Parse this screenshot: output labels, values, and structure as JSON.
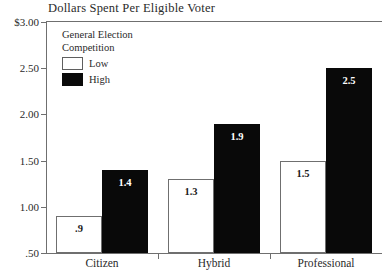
{
  "chart_data": {
    "type": "bar",
    "title": "Dollars Spent Per Eligible Voter",
    "xlabel": "",
    "ylabel": "",
    "categories": [
      "Citizen",
      "Hybrid",
      "Professional"
    ],
    "series": [
      {
        "name": "Low",
        "values": [
          0.9,
          1.3,
          1.5
        ],
        "labels": [
          ".9",
          "1.3",
          "1.5"
        ],
        "color": "#ffffff"
      },
      {
        "name": "High",
        "values": [
          1.4,
          1.9,
          2.5
        ],
        "labels": [
          "1.4",
          "1.9",
          "2.5"
        ],
        "color": "#090909"
      }
    ],
    "ylim": [
      0.5,
      3.0
    ],
    "ytick_values": [
      3.0,
      2.5,
      2.0,
      1.5,
      1.0,
      0.5
    ],
    "ytick_labels": [
      "$3.00",
      "2.50",
      "2.00",
      "1.50",
      "1.00",
      ".50"
    ],
    "grid": false,
    "legend_position": "inside-top-left"
  },
  "legend": {
    "title_line1": "General Election",
    "title_line2": "Competition",
    "entries": [
      {
        "label": "Low",
        "swatch": "white-square-outline"
      },
      {
        "label": "High",
        "swatch": "black-square-filled"
      }
    ]
  },
  "colors": {
    "low_fill": "#ffffff",
    "high_fill": "#090909",
    "axis": "#6f6f6f",
    "text": "#2a2a2a",
    "background": "#ffffff"
  }
}
